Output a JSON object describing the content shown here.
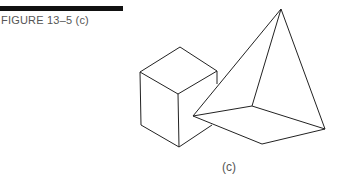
{
  "figure": {
    "title": "FIGURE 13–5 (c)",
    "caption": "(c)",
    "shapes": [
      "cube",
      "pyramid"
    ],
    "stroke_color": "#222222"
  }
}
